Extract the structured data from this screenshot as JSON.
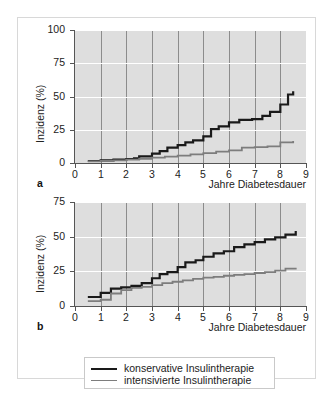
{
  "figure": {
    "panel_letters": {
      "a": "a",
      "b": "b"
    }
  },
  "legend": {
    "items": [
      {
        "label": "konservative Insulintherapie",
        "color": "#1a1a1a",
        "width": 2.2
      },
      {
        "label": "intensivierte Insulintherapie",
        "color": "#7d7d7d",
        "width": 1.8
      }
    ]
  },
  "chart_data": [
    {
      "id": "panel-a",
      "type": "line",
      "drawstyle": "steps-post",
      "title": "",
      "xlabel": "Jahre Diabetesdauer",
      "ylabel": "Inzidenz (%)",
      "xlim": [
        0,
        9
      ],
      "ylim": [
        0,
        100
      ],
      "xticks": [
        0,
        1,
        2,
        3,
        4,
        5,
        6,
        7,
        8,
        9
      ],
      "xticklabels": [
        "0",
        "1",
        "2",
        "3",
        "4",
        "5",
        "6",
        "7",
        "8",
        "9"
      ],
      "yticks": [
        0,
        25,
        50,
        75,
        100
      ],
      "yticklabels": [
        "0",
        "25",
        "50",
        "75",
        "100"
      ],
      "grid": {
        "vertical": true,
        "horizontal": true,
        "vcolor": "#8c8c8c",
        "hcolor": "#ffffff"
      },
      "plot_bg": "#dedede",
      "series": [
        {
          "name": "konservative Insulintherapie",
          "color": "#1a1a1a",
          "width": 2.2,
          "x": [
            0.5,
            1.0,
            1.5,
            2.0,
            2.3,
            2.5,
            3.0,
            3.3,
            3.6,
            4.0,
            4.3,
            4.6,
            5.0,
            5.3,
            5.6,
            6.0,
            6.4,
            6.9,
            7.3,
            7.6,
            8.0,
            8.3,
            8.5
          ],
          "y": [
            1.5,
            2.0,
            2.5,
            3.0,
            3.5,
            5.0,
            7.0,
            9.0,
            11.5,
            13.5,
            15.5,
            17.0,
            20.0,
            25.5,
            27.5,
            30.5,
            32.5,
            33.0,
            35.5,
            38.5,
            44.0,
            51.5,
            54.0
          ]
        },
        {
          "name": "intensivierte Insulintherapie",
          "color": "#7d7d7d",
          "width": 1.8,
          "x": [
            0.5,
            1.0,
            1.5,
            2.0,
            2.5,
            3.0,
            3.5,
            4.0,
            4.5,
            5.0,
            5.5,
            6.0,
            6.5,
            7.0,
            7.5,
            8.0,
            8.5
          ],
          "y": [
            1.2,
            1.6,
            2.0,
            2.5,
            3.2,
            4.0,
            4.8,
            5.5,
            6.5,
            7.5,
            8.5,
            9.5,
            11.5,
            12.0,
            12.5,
            15.5,
            16.5
          ]
        }
      ]
    },
    {
      "id": "panel-b",
      "type": "line",
      "drawstyle": "steps-post",
      "title": "",
      "xlabel": "Jahre Diabetesdauer",
      "ylabel": "Inzidenz (%)",
      "xlim": [
        0,
        9
      ],
      "ylim": [
        0,
        75
      ],
      "xticks": [
        0,
        1,
        2,
        3,
        4,
        5,
        6,
        7,
        8,
        9
      ],
      "xticklabels": [
        "0",
        "1",
        "2",
        "3",
        "4",
        "5",
        "6",
        "7",
        "8",
        "9"
      ],
      "yticks": [
        0,
        25,
        50,
        75
      ],
      "yticklabels": [
        "0",
        "25",
        "50",
        "75"
      ],
      "grid": {
        "vertical": true,
        "horizontal": true,
        "vcolor": "#8c8c8c",
        "hcolor": "#ffffff"
      },
      "plot_bg": "#dedede",
      "series": [
        {
          "name": "konservative Insulintherapie",
          "color": "#1a1a1a",
          "width": 2.2,
          "x": [
            0.5,
            1.0,
            1.4,
            1.8,
            2.2,
            2.6,
            3.0,
            3.3,
            3.6,
            4.0,
            4.3,
            4.7,
            5.0,
            5.4,
            5.8,
            6.2,
            6.6,
            7.0,
            7.4,
            7.8,
            8.2,
            8.6
          ],
          "y": [
            6.5,
            9.5,
            12.5,
            13.5,
            14.5,
            16.5,
            20.0,
            23.0,
            24.5,
            28.0,
            31.5,
            33.0,
            35.5,
            38.0,
            39.5,
            42.5,
            44.5,
            46.0,
            48.0,
            49.5,
            51.5,
            54.0
          ]
        },
        {
          "name": "intensivierte Insulintherapie",
          "color": "#7d7d7d",
          "width": 1.8,
          "x": [
            0.5,
            1.0,
            1.4,
            1.8,
            2.2,
            2.6,
            3.0,
            3.4,
            3.8,
            4.2,
            4.6,
            5.0,
            5.4,
            5.8,
            6.2,
            6.6,
            7.0,
            7.4,
            7.8,
            8.2,
            8.6
          ],
          "y": [
            3.5,
            4.5,
            9.0,
            11.5,
            13.0,
            13.8,
            15.0,
            16.5,
            17.5,
            18.5,
            19.5,
            20.5,
            21.0,
            21.8,
            22.5,
            23.0,
            23.8,
            24.5,
            25.5,
            27.0,
            27.5
          ]
        }
      ]
    }
  ]
}
